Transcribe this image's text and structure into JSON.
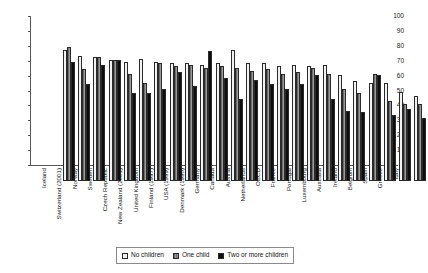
{
  "chart_data": {
    "type": "bar",
    "title": "",
    "subtitle": "",
    "xlabel": "",
    "ylabel": "",
    "ylim": [
      0,
      100
    ],
    "yticks": [
      0,
      10,
      20,
      30,
      40,
      50,
      60,
      70,
      80,
      90,
      100
    ],
    "grid": false,
    "legend_position": "bottom-center",
    "orientation": "vertical",
    "grouping": "clustered",
    "categories": [
      "Iceland",
      "Switzerland (2001)",
      "Norway",
      "Sweden",
      "Czech Republic",
      "New Zealand (2001)",
      "United Kingdom",
      "Finland (1997)",
      "USA (1999)",
      "Denmark (1998)",
      "Germany",
      "Canada",
      "Austria",
      "Netherlands",
      "OECD",
      "France",
      "Portugal",
      "Luxembourg",
      "Australia",
      "Ireland",
      "Belgium",
      "Spain",
      "Greece",
      "Italy"
    ],
    "series": [
      {
        "name": "No children",
        "color": "#f2f2f2",
        "values": [
          88,
          84,
          83,
          81,
          80,
          82,
          80,
          79,
          79,
          78,
          79,
          88,
          79,
          79,
          77,
          78,
          77,
          78,
          71,
          67,
          66,
          66,
          60,
          57
        ]
      },
      {
        "name": "One child",
        "color": "#8a8a8a",
        "values": [
          90,
          75,
          83,
          81,
          72,
          66,
          79,
          77,
          78,
          76,
          77,
          76,
          74,
          75,
          72,
          73,
          76,
          72,
          62,
          59,
          72,
          54,
          52,
          52
        ]
      },
      {
        "name": "Two or more children",
        "color": "#0d0d0d",
        "values": [
          80,
          65,
          78,
          81,
          59,
          59,
          62,
          73,
          64,
          87,
          69,
          55,
          68,
          65,
          62,
          65,
          71,
          55,
          47,
          46,
          71,
          44,
          48,
          42
        ]
      }
    ]
  },
  "legend": {
    "items": [
      {
        "label": "No children",
        "swatch": "legend-swatch-no-children"
      },
      {
        "label": "One child",
        "swatch": "legend-swatch-one-child"
      },
      {
        "label": "Two or more children",
        "swatch": "legend-swatch-two-or-more-children"
      }
    ]
  }
}
